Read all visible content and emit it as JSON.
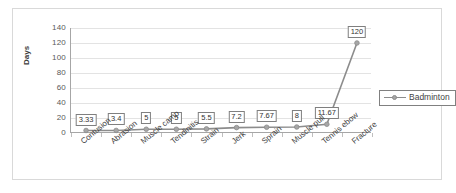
{
  "chart_data": {
    "type": "line",
    "title": "",
    "xlabel": "",
    "ylabel": "Days",
    "ylim": [
      0,
      140
    ],
    "yticks": [
      140,
      120,
      100,
      80,
      60,
      40,
      20,
      0
    ],
    "grid": true,
    "legend_position": "right",
    "categories": [
      "Contusion",
      "Abrasion",
      "Muscle camp",
      "Tendinitis",
      "Strain",
      "Jerk",
      "Sprain",
      "Muscle pull",
      "Tennis ebow",
      "Fracture"
    ],
    "series": [
      {
        "name": "Badminton",
        "values": [
          3.33,
          3.4,
          5,
          5,
          5.5,
          7.2,
          7.67,
          8,
          11.67,
          120
        ],
        "labels": [
          "3.33",
          "3.4",
          "5",
          "5",
          "5.5",
          "7.2",
          "7.67",
          "8",
          "11.67",
          "120"
        ],
        "color": "#8c8c8c",
        "marker_color": "#a6a6a6"
      }
    ]
  },
  "legend": {
    "entries": [
      {
        "label": "Badminton"
      }
    ]
  },
  "colors": {
    "series_line": "#8c8c8c",
    "marker": "#a6a6a6",
    "gridline": "#e3e3e3",
    "axis": "#a6a6a6",
    "frame": "#d9d9d9",
    "text": "#404040"
  }
}
